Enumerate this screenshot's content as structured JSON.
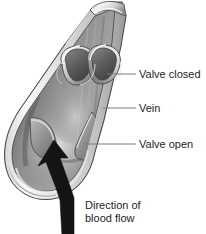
{
  "figure": {
    "subject": "vein",
    "view": "longitudinal cut-away",
    "background_color": "#ffffff",
    "ink_color": "#231f20",
    "leader_line_color": "#808080",
    "arrow_color": "#1a1a1a",
    "tissue_colors": {
      "wall_outer_light": "#e8e8e8",
      "wall_mid": "#b9b9b9",
      "lumen_dark": "#6a6a6a",
      "lumen_mid": "#8f8f8f",
      "highlight": "#f2f2f2",
      "shadow": "#4a4a4a",
      "outline": "#3a3a3a"
    }
  },
  "labels": {
    "valve_closed": "Valve closed",
    "vein": "Vein",
    "valve_open": "Valve open",
    "direction_line1": "Direction of",
    "direction_line2": "blood flow"
  },
  "annotations": [
    {
      "id": "valve-closed",
      "text": "Valve closed",
      "leader_from_x": 108,
      "leader_from_y": 74,
      "leader_to_x": 136,
      "leader_to_y": 74,
      "target": "upper-valve-cusps"
    },
    {
      "id": "vein",
      "text": "Vein",
      "leader_from_x": 104,
      "leader_from_y": 108,
      "leader_to_x": 136,
      "leader_to_y": 108,
      "target": "vein-wall"
    },
    {
      "id": "valve-open",
      "text": "Valve open",
      "leader_from_x": 86,
      "leader_from_y": 144,
      "leader_to_x": 136,
      "leader_to_y": 144,
      "target": "lower-valve-flap"
    },
    {
      "id": "direction-of-blood-flow",
      "text": "Direction of blood flow",
      "target": "flow-arrow",
      "arrow_direction": "upward"
    }
  ],
  "structures": [
    {
      "name": "vein-wall",
      "description": "Tapered tubular vessel wall, cut open lengthwise"
    },
    {
      "name": "vein-lumen",
      "description": "Interior cavity of the vein, shaded dark"
    },
    {
      "name": "upper-valve-cusps",
      "description": "Two semilunar cusps meeting in the middle: valve closed"
    },
    {
      "name": "lower-valve-flap",
      "description": "Two cusps flattened against the wall: valve open"
    },
    {
      "name": "flow-arrow",
      "description": "Thick black arrow pointing upward through the lumen"
    }
  ]
}
